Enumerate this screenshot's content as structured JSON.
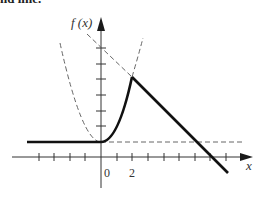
{
  "caption": "nd line.",
  "diagram": {
    "y_axis_label": "f (x)",
    "x_axis_label": "x",
    "tick_labels": {
      "origin": "0",
      "two": "2"
    },
    "colors": {
      "ink": "#1a1a1a",
      "dashed": "#666666",
      "background": "#ffffff"
    },
    "elements": [
      "piecewise function f(x): constant 1 for x<0, 1+x^2 for 0<=x<=2, linear decreasing for x>2",
      "dashed parabola y = 1 + x^2",
      "dashed horizontal line y = 1",
      "dashed extension of decreasing line"
    ]
  }
}
